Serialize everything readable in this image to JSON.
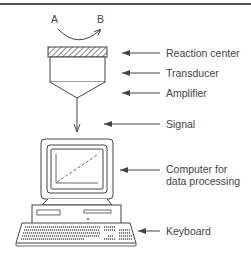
{
  "diagram": {
    "type": "biosensor schematic",
    "reaction": {
      "from": "A",
      "to": "B"
    },
    "labels": {
      "reaction_center": "Reaction center",
      "transducer": "Transducer",
      "amplifier": "Amplifier",
      "signal": "Signal",
      "computer_line1": "Computer for",
      "computer_line2": "data processing",
      "keyboard": "Keyboard"
    },
    "colors": {
      "line": "#444444",
      "background": "#ffffff"
    }
  }
}
